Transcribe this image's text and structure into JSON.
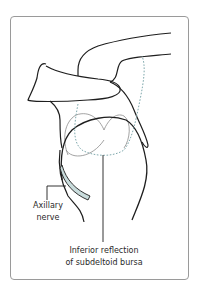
{
  "diagram": {
    "labels": {
      "axillary_nerve_line1": "Axillary",
      "axillary_nerve_line2": "nerve",
      "bursa_line1": "Inferior reflection",
      "bursa_line2": "of subdeltoid bursa"
    },
    "colors": {
      "outline": "#1e1e1e",
      "bursa_dotted": "#7fa9ad",
      "humeral_head_thin": "#8c8c8c",
      "nerve_fill": "#c9dcdc",
      "frame_border": "#9a9a9a",
      "text": "#2a2a2a"
    }
  }
}
